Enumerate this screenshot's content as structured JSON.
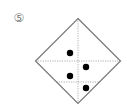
{
  "figure": {
    "label": "⑤",
    "shape": "diamond (square rotated 45°)",
    "diamond": {
      "cx": 78,
      "cy": 61,
      "half": 42.5,
      "stroke": "#777777"
    },
    "fold_lines": [
      {
        "type": "vertical",
        "x": 78,
        "style": "dotted"
      },
      {
        "type": "horizontal",
        "y": 61,
        "style": "dotted"
      },
      {
        "type": "horizontal",
        "y": 82,
        "style": "dotted"
      }
    ],
    "dots": [
      {
        "x": 70,
        "y": 53
      },
      {
        "x": 86,
        "y": 67
      },
      {
        "x": 70,
        "y": 76
      },
      {
        "x": 86,
        "y": 88
      }
    ],
    "dot_color": "#000000"
  }
}
